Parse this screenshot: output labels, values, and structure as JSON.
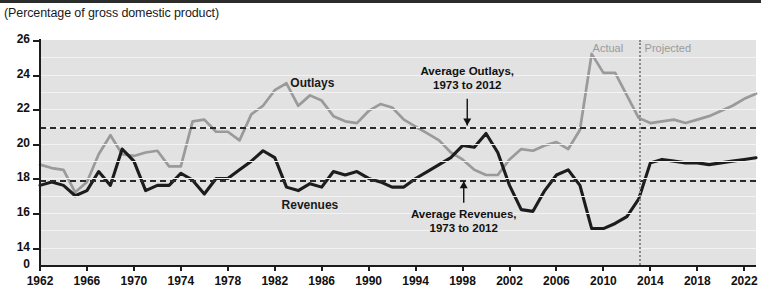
{
  "subtitle": "(Percentage of gross domestic product)",
  "era": {
    "actual": "Actual",
    "projected": "Projected"
  },
  "series_labels": {
    "outlays": "Outlays",
    "revenues": "Revenues"
  },
  "callouts": {
    "outlays_line1": "Average Outlays,",
    "outlays_line2": "1973 to 2012",
    "revenues_line1": "Average Revenues,",
    "revenues_line2": "1973 to 2012"
  },
  "colors": {
    "outlays": "#9a9a9a",
    "revenues": "#1c1c1c",
    "plot_background": "#e2e2e2",
    "gridline": "#f3f3f3",
    "average_line": "#2a2a2a",
    "divider": "#8a8a8a",
    "era_text": "#9a9a9a"
  },
  "chart_data": {
    "type": "line",
    "title": "",
    "subtitle": "(Percentage of gross domestic product)",
    "xlabel": "",
    "ylabel": "",
    "xlim": [
      1962,
      2023
    ],
    "ylim": [
      13,
      26
    ],
    "yticks": [
      26,
      24,
      22,
      20,
      18,
      16,
      14,
      0
    ],
    "axis_break_below": 14,
    "xticks": [
      1962,
      1966,
      1970,
      1974,
      1978,
      1982,
      1986,
      1990,
      1994,
      1998,
      2002,
      2006,
      2010,
      2014,
      2018,
      2022
    ],
    "grid": true,
    "legend": "inline-labels",
    "projection_start_year": 2013,
    "annotations": [
      {
        "name": "average-outlays",
        "text": "Average Outlays, 1973 to 2012",
        "value": 21.0,
        "style": "dashed-horizontal"
      },
      {
        "name": "average-revenues",
        "text": "Average Revenues, 1973 to 2012",
        "value": 17.9,
        "style": "dashed-horizontal"
      },
      {
        "name": "actual-projected-divider",
        "year": 2013,
        "style": "dotted-vertical"
      }
    ],
    "x": [
      1962,
      1963,
      1964,
      1965,
      1966,
      1967,
      1968,
      1969,
      1970,
      1971,
      1972,
      1973,
      1974,
      1975,
      1976,
      1977,
      1978,
      1979,
      1980,
      1981,
      1982,
      1983,
      1984,
      1985,
      1986,
      1987,
      1988,
      1989,
      1990,
      1991,
      1992,
      1993,
      1994,
      1995,
      1996,
      1997,
      1998,
      1999,
      2000,
      2001,
      2002,
      2003,
      2004,
      2005,
      2006,
      2007,
      2008,
      2009,
      2010,
      2011,
      2012,
      2013,
      2014,
      2015,
      2016,
      2017,
      2018,
      2019,
      2020,
      2021,
      2022,
      2023
    ],
    "series": [
      {
        "name": "Outlays",
        "color": "#9a9a9a",
        "values": [
          18.8,
          18.6,
          18.5,
          17.2,
          17.8,
          19.4,
          20.5,
          19.4,
          19.3,
          19.5,
          19.6,
          18.7,
          18.7,
          21.3,
          21.4,
          20.7,
          20.7,
          20.2,
          21.7,
          22.2,
          23.1,
          23.5,
          22.2,
          22.8,
          22.5,
          21.6,
          21.3,
          21.2,
          21.9,
          22.3,
          22.1,
          21.4,
          21.0,
          20.6,
          20.2,
          19.5,
          19.1,
          18.5,
          18.2,
          18.2,
          19.1,
          19.7,
          19.6,
          19.9,
          20.1,
          19.7,
          20.8,
          25.2,
          24.1,
          24.1,
          22.8,
          21.5,
          21.2,
          21.3,
          21.4,
          21.2,
          21.4,
          21.6,
          21.9,
          22.2,
          22.6,
          22.9
        ]
      },
      {
        "name": "Revenues",
        "color": "#1c1c1c",
        "values": [
          17.6,
          17.8,
          17.6,
          17.0,
          17.3,
          18.4,
          17.6,
          19.7,
          19.0,
          17.3,
          17.6,
          17.6,
          18.3,
          17.9,
          17.1,
          18.0,
          18.0,
          18.5,
          19.0,
          19.6,
          19.2,
          17.5,
          17.3,
          17.7,
          17.5,
          18.4,
          18.2,
          18.4,
          18.0,
          17.8,
          17.5,
          17.5,
          18.0,
          18.4,
          18.8,
          19.2,
          19.9,
          19.8,
          20.6,
          19.5,
          17.6,
          16.2,
          16.1,
          17.3,
          18.2,
          18.5,
          17.6,
          15.1,
          15.1,
          15.4,
          15.8,
          16.8,
          18.9,
          19.1,
          19.0,
          18.9,
          18.9,
          18.8,
          18.9,
          19.0,
          19.1,
          19.2
        ]
      }
    ]
  }
}
